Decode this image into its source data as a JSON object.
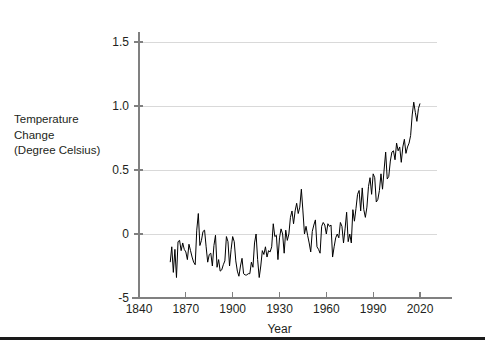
{
  "chart_data": {
    "type": "line",
    "title": "",
    "subtitle": "",
    "xlabel": "Year",
    "ylabel": "Temperature Change (Degree Celsius)",
    "ylabel_lines": [
      "Temperature",
      "Change",
      "(Degree Celsius)"
    ],
    "xlim": [
      1840,
      2030
    ],
    "ylim": [
      -0.5,
      1.62
    ],
    "xticks": [
      1840,
      1870,
      1900,
      1930,
      1960,
      1990,
      2020
    ],
    "xtick_labels": [
      "1840",
      "1870",
      "1900",
      "1930",
      "1960",
      "1990",
      "2020"
    ],
    "yticks": [
      -0.5,
      0,
      0.5,
      1.0,
      1.5
    ],
    "ytick_labels": [
      "-5",
      "0",
      "0.5",
      "1.0",
      "1.5"
    ],
    "grid": true,
    "grid_color": "#d9d9d9",
    "axis_color": "#808080",
    "line_color": "#000000",
    "line_width": 1.0,
    "legend": null,
    "legend_position": "none",
    "series": [
      {
        "name": "Global temperature change",
        "x": [
          1860,
          1861,
          1862,
          1863,
          1864,
          1865,
          1866,
          1867,
          1868,
          1869,
          1870,
          1871,
          1872,
          1873,
          1874,
          1875,
          1876,
          1877,
          1878,
          1879,
          1880,
          1881,
          1882,
          1883,
          1884,
          1885,
          1886,
          1887,
          1888,
          1889,
          1890,
          1891,
          1892,
          1893,
          1894,
          1895,
          1896,
          1897,
          1898,
          1899,
          1900,
          1901,
          1902,
          1903,
          1904,
          1905,
          1906,
          1907,
          1908,
          1909,
          1910,
          1911,
          1912,
          1913,
          1914,
          1915,
          1916,
          1917,
          1918,
          1919,
          1920,
          1921,
          1922,
          1923,
          1924,
          1925,
          1926,
          1927,
          1928,
          1929,
          1930,
          1931,
          1932,
          1933,
          1934,
          1935,
          1936,
          1937,
          1938,
          1939,
          1940,
          1941,
          1942,
          1943,
          1944,
          1945,
          1946,
          1947,
          1948,
          1949,
          1950,
          1951,
          1952,
          1953,
          1954,
          1955,
          1956,
          1957,
          1958,
          1959,
          1960,
          1961,
          1962,
          1963,
          1964,
          1965,
          1966,
          1967,
          1968,
          1969,
          1970,
          1971,
          1972,
          1973,
          1974,
          1975,
          1976,
          1977,
          1978,
          1979,
          1980,
          1981,
          1982,
          1983,
          1984,
          1985,
          1986,
          1987,
          1988,
          1989,
          1990,
          1991,
          1992,
          1993,
          1994,
          1995,
          1996,
          1997,
          1998,
          1999,
          2000,
          2001,
          2002,
          2003,
          2004,
          2005,
          2006,
          2007,
          2008,
          2009,
          2010,
          2011,
          2012,
          2013,
          2014,
          2015,
          2016,
          2017,
          2018,
          2019,
          2020
        ],
        "y": [
          -0.22,
          -0.1,
          -0.3,
          -0.12,
          -0.34,
          -0.06,
          -0.05,
          -0.13,
          -0.07,
          -0.12,
          -0.14,
          -0.2,
          -0.08,
          -0.13,
          -0.18,
          -0.22,
          -0.24,
          0.03,
          0.16,
          -0.09,
          -0.05,
          0.02,
          0.03,
          -0.1,
          -0.22,
          -0.16,
          -0.15,
          -0.25,
          -0.09,
          -0.01,
          -0.26,
          -0.2,
          -0.29,
          -0.28,
          -0.24,
          -0.21,
          -0.02,
          -0.06,
          -0.25,
          -0.12,
          -0.02,
          -0.06,
          -0.21,
          -0.29,
          -0.33,
          -0.25,
          -0.19,
          -0.31,
          -0.32,
          -0.32,
          -0.31,
          -0.31,
          -0.22,
          -0.26,
          -0.07,
          0.0,
          -0.2,
          -0.34,
          -0.25,
          -0.13,
          -0.16,
          -0.1,
          -0.18,
          -0.13,
          -0.14,
          -0.1,
          0.08,
          -0.02,
          -0.01,
          -0.2,
          -0.03,
          0.04,
          0.0,
          -0.15,
          0.03,
          -0.05,
          0.0,
          0.13,
          0.18,
          0.08,
          0.18,
          0.24,
          0.16,
          0.21,
          0.35,
          0.18,
          0.0,
          0.06,
          -0.01,
          -0.07,
          -0.14,
          0.02,
          0.07,
          0.11,
          -0.1,
          -0.12,
          -0.15,
          0.06,
          0.09,
          0.07,
          0.0,
          0.08,
          0.06,
          0.07,
          -0.18,
          -0.1,
          -0.03,
          0.0,
          -0.03,
          0.09,
          0.06,
          -0.07,
          0.04,
          0.17,
          -0.06,
          0.0,
          -0.07,
          0.19,
          0.1,
          0.2,
          0.31,
          0.34,
          0.18,
          0.36,
          0.19,
          0.13,
          0.21,
          0.37,
          0.44,
          0.31,
          0.47,
          0.44,
          0.25,
          0.27,
          0.34,
          0.47,
          0.35,
          0.5,
          0.64,
          0.43,
          0.45,
          0.57,
          0.64,
          0.65,
          0.58,
          0.71,
          0.65,
          0.68,
          0.56,
          0.68,
          0.74,
          0.63,
          0.68,
          0.71,
          0.77,
          0.93,
          1.03,
          0.95,
          0.88,
          0.98,
          1.02
        ],
        "note": "High-frequency annual series; as rendered the curve spans roughly -0.34 at its 1870s minimum up to about 1.52 near 2016."
      }
    ]
  },
  "figure": {
    "background_color": "#ffffff",
    "bottom_rule_color": "#1a1a1a"
  }
}
